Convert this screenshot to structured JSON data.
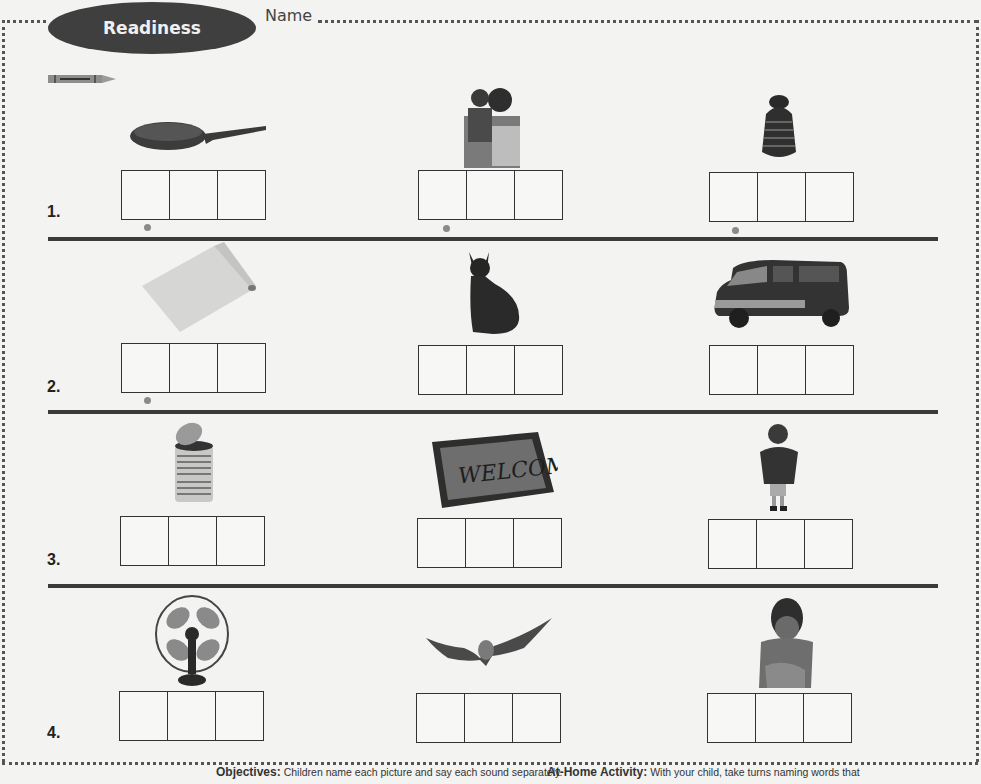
{
  "header": {
    "badge_label": "Readiness",
    "name_label": "Name",
    "crayon_icon": "crayon-icon"
  },
  "rows": [
    {
      "number": "1.",
      "items": [
        {
          "picture": "frying-pan",
          "boxes": 3,
          "dot_marker": true
        },
        {
          "picture": "father-holding-child",
          "boxes": 3,
          "dot_marker": true
        },
        {
          "picture": "yarn-hat",
          "boxes": 3,
          "dot_marker": true
        }
      ]
    },
    {
      "number": "2.",
      "items": [
        {
          "picture": "paper-roll",
          "boxes": 3,
          "dot_marker": true
        },
        {
          "picture": "cat",
          "boxes": 3,
          "dot_marker": false
        },
        {
          "picture": "van",
          "boxes": 3,
          "dot_marker": false
        }
      ]
    },
    {
      "number": "3.",
      "items": [
        {
          "picture": "open-can",
          "boxes": 3,
          "dot_marker": false
        },
        {
          "picture": "welcome-mat",
          "boxes": 3,
          "dot_marker": false
        },
        {
          "picture": "boy-standing",
          "boxes": 3,
          "dot_marker": false
        }
      ]
    },
    {
      "number": "4.",
      "items": [
        {
          "picture": "electric-fan",
          "boxes": 3,
          "dot_marker": false
        },
        {
          "picture": "bat",
          "boxes": 3,
          "dot_marker": false
        },
        {
          "picture": "boy-sitting",
          "boxes": 3,
          "dot_marker": false
        }
      ]
    }
  ],
  "welcome_mat_text": "WELCOME",
  "footer": {
    "objectives_label": "Objectives:",
    "objectives_text": "Children name each picture and say each sound separately.",
    "home_label": "At-Home Activity:",
    "home_text": "With your child, take turns naming words that"
  },
  "colors": {
    "badge": "#3f3f3f",
    "rule": "#3a3a3a",
    "dot": "#8a8a8a",
    "background": "#f3f3f1"
  }
}
